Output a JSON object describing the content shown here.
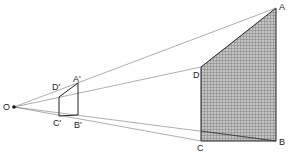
{
  "diagram": {
    "title": "",
    "colors": {
      "background": "#ffffff",
      "rays": "#777777",
      "edges": "#222222",
      "fill": "#b8b8b8",
      "grid": "#8a8a8a"
    },
    "center": {
      "label": "O",
      "x": 14,
      "y": 107
    },
    "large_shape": {
      "points": {
        "A": {
          "label": "A",
          "x": 276,
          "y": 8
        },
        "B": {
          "label": "B",
          "x": 276,
          "y": 141
        },
        "C": {
          "label": "C",
          "x": 201,
          "y": 141
        },
        "D": {
          "label": "D",
          "x": 201,
          "y": 67
        }
      },
      "shaded": true
    },
    "small_shape": {
      "points": {
        "A'": {
          "label": "A'",
          "x": 78,
          "y": 83
        },
        "B'": {
          "label": "B'",
          "x": 78,
          "y": 115
        },
        "C'": {
          "label": "C'",
          "x": 59,
          "y": 116
        },
        "D'": {
          "label": "D'",
          "x": 59,
          "y": 97
        }
      },
      "shaded": false
    },
    "labels": {
      "O": "O",
      "A": "A",
      "B": "B",
      "C": "C",
      "D": "D",
      "A_prime": "A'",
      "B_prime": "B'",
      "C_prime": "C'",
      "D_prime": "D'"
    }
  }
}
